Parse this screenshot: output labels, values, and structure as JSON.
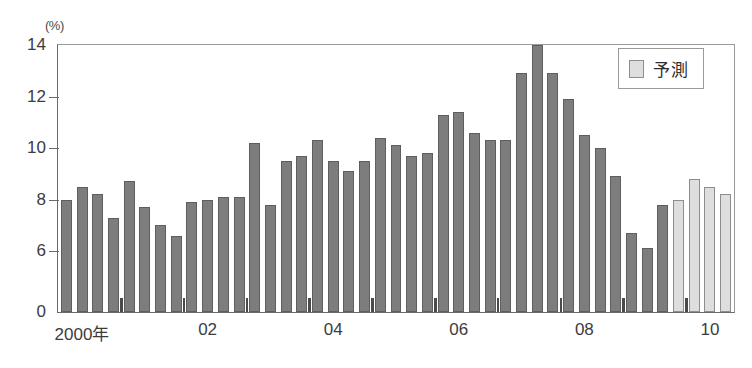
{
  "chart_data": {
    "type": "bar",
    "title": "",
    "subtitle": "",
    "unit_label": "(%)",
    "xlabel": "",
    "ylabel": "(%)",
    "ylim": [
      0,
      14
    ],
    "y_ticks": [
      {
        "value": 14,
        "label": "14"
      },
      {
        "value": 12,
        "label": "12"
      },
      {
        "value": 10,
        "label": "10"
      },
      {
        "value": 8,
        "label": "8"
      },
      {
        "value": 6,
        "label": "6"
      },
      {
        "value": 0,
        "label": "0"
      }
    ],
    "axis_break": true,
    "grid": false,
    "legend": {
      "position": "top-right",
      "entries": [
        {
          "label": "予測",
          "color": "#dedede",
          "type": "forecast"
        }
      ]
    },
    "x_tick_labels": [
      {
        "label": "2000年",
        "index": 1.5
      },
      {
        "label": "02",
        "index": 9.5
      },
      {
        "label": "04",
        "index": 17.5
      },
      {
        "label": "06",
        "index": 25.5
      },
      {
        "label": "08",
        "index": 33.5
      },
      {
        "label": "10",
        "index": 41.5
      }
    ],
    "categories": [
      "2000Q1",
      "2000Q2",
      "2000Q3",
      "2000Q4",
      "2001Q1",
      "2001Q2",
      "2001Q3",
      "2001Q4",
      "2002Q1",
      "2002Q2",
      "2002Q3",
      "2002Q4",
      "2003Q1",
      "2003Q2",
      "2003Q3",
      "2003Q4",
      "2004Q1",
      "2004Q2",
      "2004Q3",
      "2004Q4",
      "2005Q1",
      "2005Q2",
      "2005Q3",
      "2005Q4",
      "2006Q1",
      "2006Q2",
      "2006Q3",
      "2006Q4",
      "2007Q1",
      "2007Q2",
      "2007Q3",
      "2007Q4",
      "2008Q1",
      "2008Q2",
      "2008Q3",
      "2008Q4",
      "2009Q1",
      "2009Q2",
      "2009Q3",
      "2009Q4",
      "2010Q1",
      "2010Q2",
      "2010Q3",
      "2010Q4"
    ],
    "series": [
      {
        "name": "実績",
        "color": "#7d7d7d",
        "values": [
          8.0,
          8.5,
          8.2,
          7.3,
          8.7,
          7.7,
          7.0,
          6.6,
          7.9,
          8.0,
          8.1,
          8.1,
          10.2,
          7.8,
          9.5,
          9.7,
          10.3,
          9.5,
          9.1,
          9.5,
          10.4,
          10.1,
          9.7,
          9.8,
          11.3,
          11.4,
          10.6,
          10.3,
          10.3,
          12.9,
          14.0,
          12.9,
          11.9,
          10.5,
          10.0,
          8.9,
          6.7,
          6.1,
          7.8,
          null,
          null,
          null,
          null,
          null
        ]
      },
      {
        "name": "予測",
        "color": "#dedede",
        "values": [
          null,
          null,
          null,
          null,
          null,
          null,
          null,
          null,
          null,
          null,
          null,
          null,
          null,
          null,
          null,
          null,
          null,
          null,
          null,
          null,
          null,
          null,
          null,
          null,
          null,
          null,
          null,
          null,
          null,
          null,
          null,
          null,
          null,
          null,
          null,
          null,
          null,
          null,
          null,
          8.0,
          8.8,
          8.5,
          8.2,
          null
        ]
      }
    ],
    "bar_count": 43,
    "forecast_start_index": 39
  }
}
